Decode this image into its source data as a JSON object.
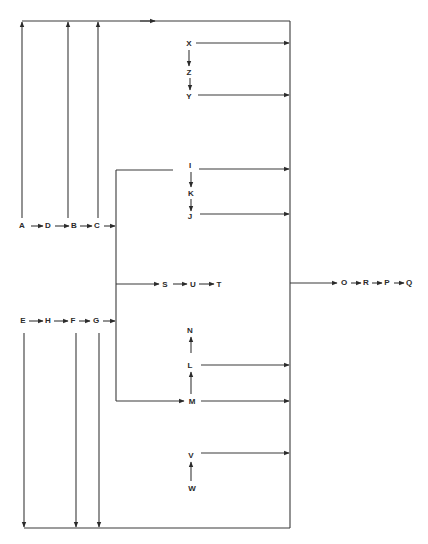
{
  "diagram": {
    "type": "flow-network",
    "nodes": [
      {
        "id": "A",
        "label": "A",
        "x": 22,
        "y": 225
      },
      {
        "id": "D",
        "label": "D",
        "x": 48,
        "y": 225
      },
      {
        "id": "B",
        "label": "B",
        "x": 74,
        "y": 225
      },
      {
        "id": "C",
        "label": "C",
        "x": 97,
        "y": 225
      },
      {
        "id": "E",
        "label": "E",
        "x": 23,
        "y": 320
      },
      {
        "id": "H",
        "label": "H",
        "x": 48,
        "y": 320
      },
      {
        "id": "F",
        "label": "F",
        "x": 73,
        "y": 320
      },
      {
        "id": "G",
        "label": "G",
        "x": 96,
        "y": 320
      },
      {
        "id": "X",
        "label": "X",
        "x": 189,
        "y": 43
      },
      {
        "id": "Z",
        "label": "Z",
        "x": 189,
        "y": 72
      },
      {
        "id": "Y",
        "label": "Y",
        "x": 189,
        "y": 96
      },
      {
        "id": "I",
        "label": "I",
        "x": 190,
        "y": 165
      },
      {
        "id": "K",
        "label": "K",
        "x": 191,
        "y": 193
      },
      {
        "id": "J",
        "label": "J",
        "x": 190,
        "y": 216
      },
      {
        "id": "S",
        "label": "S",
        "x": 165,
        "y": 284
      },
      {
        "id": "U",
        "label": "U",
        "x": 193,
        "y": 284
      },
      {
        "id": "T",
        "label": "T",
        "x": 219,
        "y": 284
      },
      {
        "id": "N",
        "label": "N",
        "x": 190,
        "y": 330
      },
      {
        "id": "L",
        "label": "L",
        "x": 190,
        "y": 365
      },
      {
        "id": "M",
        "label": "M",
        "x": 192,
        "y": 401
      },
      {
        "id": "V",
        "label": "V",
        "x": 191,
        "y": 455
      },
      {
        "id": "W",
        "label": "W",
        "x": 192,
        "y": 488
      },
      {
        "id": "O",
        "label": "O",
        "x": 344,
        "y": 282
      },
      {
        "id": "R",
        "label": "R",
        "x": 366,
        "y": 282
      },
      {
        "id": "P",
        "label": "P",
        "x": 387,
        "y": 282
      },
      {
        "id": "Q",
        "label": "Q",
        "x": 409,
        "y": 282
      }
    ],
    "edges": [
      {
        "from": "A",
        "to": "D"
      },
      {
        "from": "D",
        "to": "B"
      },
      {
        "from": "B",
        "to": "C"
      },
      {
        "from": "E",
        "to": "H"
      },
      {
        "from": "H",
        "to": "F"
      },
      {
        "from": "F",
        "to": "G"
      },
      {
        "from": "X",
        "to": "Z"
      },
      {
        "from": "Z",
        "to": "Y"
      },
      {
        "from": "I",
        "to": "K"
      },
      {
        "from": "K",
        "to": "J"
      },
      {
        "from": "S",
        "to": "U"
      },
      {
        "from": "U",
        "to": "T"
      },
      {
        "from": "M",
        "to": "L"
      },
      {
        "from": "L",
        "to": "N"
      },
      {
        "from": "W",
        "to": "V"
      },
      {
        "from": "O",
        "to": "R"
      },
      {
        "from": "R",
        "to": "P"
      },
      {
        "from": "P",
        "to": "Q"
      },
      {
        "from": "A",
        "to": "top-bus"
      },
      {
        "from": "B",
        "to": "top-bus"
      },
      {
        "from": "C",
        "to": "top-bus"
      },
      {
        "from": "E",
        "to": "bottom-bus"
      },
      {
        "from": "F",
        "to": "bottom-bus"
      },
      {
        "from": "G",
        "to": "bottom-bus"
      },
      {
        "from": "C",
        "to": "inner-bus"
      },
      {
        "from": "G",
        "to": "inner-bus"
      },
      {
        "from": "inner-bus",
        "to": "I"
      },
      {
        "from": "inner-bus",
        "to": "S"
      },
      {
        "from": "inner-bus",
        "to": "M"
      },
      {
        "from": "X",
        "to": "right-bus"
      },
      {
        "from": "Y",
        "to": "right-bus"
      },
      {
        "from": "I",
        "to": "right-bus"
      },
      {
        "from": "J",
        "to": "right-bus"
      },
      {
        "from": "L",
        "to": "right-bus"
      },
      {
        "from": "M",
        "to": "right-bus"
      },
      {
        "from": "V",
        "to": "right-bus"
      },
      {
        "from": "right-bus",
        "to": "O"
      }
    ],
    "buses": {
      "top": {
        "y": 21,
        "x1": 22,
        "x2": 290
      },
      "bottom": {
        "y": 528,
        "x1": 24,
        "x2": 290
      },
      "right": {
        "x": 290,
        "y1": 21,
        "y2": 528
      },
      "inner": {
        "x": 116,
        "y1": 170,
        "y2": 401
      }
    },
    "colors": {
      "line": "#3a3a3a",
      "text": "#2a2a2a",
      "background": "#ffffff"
    }
  }
}
